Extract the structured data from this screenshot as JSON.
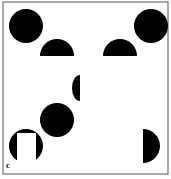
{
  "figure": {
    "panel_label": "c",
    "border_color": "#555555",
    "fill_color": "#000000",
    "background": "#ffffff",
    "shapes": [
      {
        "id": "circle-top-left",
        "type": "circle",
        "cx": 26,
        "cy": 26,
        "r": 17
      },
      {
        "id": "circle-top-right",
        "type": "circle",
        "cx": 151,
        "cy": 26,
        "r": 17
      },
      {
        "id": "semicircle-top-left",
        "type": "half-circle-top",
        "cx": 57,
        "cy": 56,
        "r": 17
      },
      {
        "id": "semicircle-top-right",
        "type": "half-circle-top",
        "cx": 120,
        "cy": 56,
        "r": 17
      },
      {
        "id": "semicircle-center-left",
        "type": "half-circle-left",
        "cx": 80,
        "cy": 88,
        "r": 8
      },
      {
        "id": "circle-middle",
        "type": "circle",
        "cx": 57,
        "cy": 120,
        "r": 17
      },
      {
        "id": "pacman-bottom-left",
        "type": "circle-with-notch",
        "cx": 26,
        "cy": 146,
        "r": 17
      },
      {
        "id": "semicircle-bottom-right",
        "type": "half-circle-right",
        "cx": 143,
        "cy": 146,
        "r": 17
      }
    ]
  }
}
